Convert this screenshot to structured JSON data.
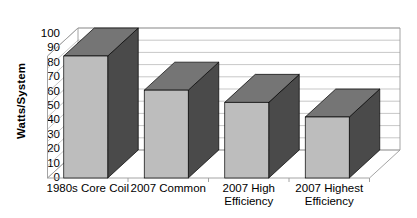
{
  "chart_data": {
    "type": "bar",
    "title": "",
    "subtitle": "",
    "xlabel": "",
    "ylabel": "Watts/System",
    "ylim": [
      0,
      100
    ],
    "ytick_step": 10,
    "yticks": [
      "100",
      "90",
      "80",
      "70",
      "60",
      "50",
      "40",
      "30",
      "20",
      "10",
      "0"
    ],
    "grid": true,
    "legend": false,
    "legend_position": "none",
    "three_d": true,
    "categories": [
      "1980s Core Coil",
      "2007 Common",
      "2007 High Efficiency",
      "2007 Highest Efficiency"
    ],
    "category_lines": [
      [
        "1980s Core Coil"
      ],
      [
        "2007 Common"
      ],
      [
        "2007 High",
        "Efficiency"
      ],
      [
        "2007 Highest",
        "Efficiency"
      ]
    ],
    "values": [
      100,
      72,
      62,
      50
    ],
    "annotations": []
  },
  "colors": {
    "bar_front": "#bdbdbd",
    "bar_side": "#4a4a4a",
    "bar_top": "#757575",
    "bar_outline": "#000000",
    "gridline": "#b9b9b9",
    "axis": "#9a9a9a",
    "background": "#ffffff",
    "text": "#000000"
  }
}
